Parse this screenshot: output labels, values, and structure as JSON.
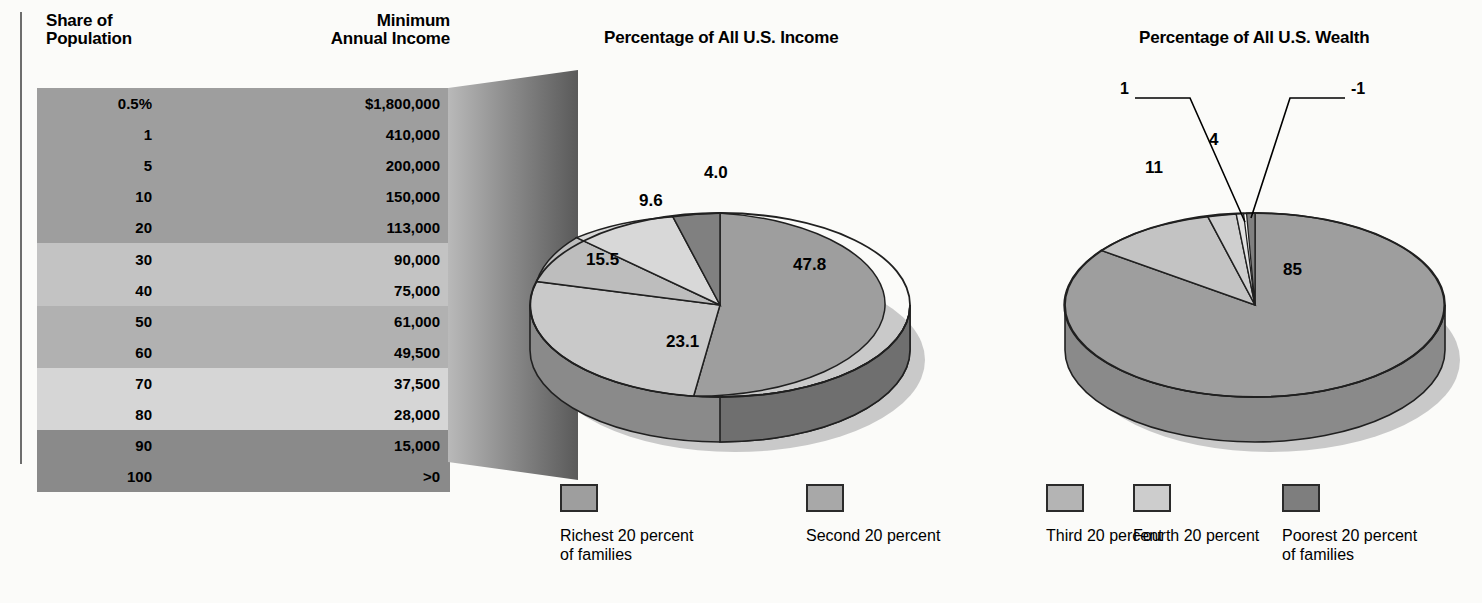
{
  "table": {
    "header_share": "Share of\nPopulation",
    "header_income": "Minimum\nAnnual Income",
    "rows": [
      {
        "pct": "0.5%",
        "amount": "$1,800,000",
        "band": "band-a"
      },
      {
        "pct": "1",
        "amount": "410,000",
        "band": "band-a"
      },
      {
        "pct": "5",
        "amount": "200,000",
        "band": "band-a"
      },
      {
        "pct": "10",
        "amount": "150,000",
        "band": "band-a"
      },
      {
        "pct": "20",
        "amount": "113,000",
        "band": "band-a"
      },
      {
        "pct": "30",
        "amount": "90,000",
        "band": "band-b"
      },
      {
        "pct": "40",
        "amount": "75,000",
        "band": "band-b"
      },
      {
        "pct": "50",
        "amount": "61,000",
        "band": "band-c"
      },
      {
        "pct": "60",
        "amount": "49,500",
        "band": "band-c"
      },
      {
        "pct": "70",
        "amount": "37,500",
        "band": "band-d"
      },
      {
        "pct": "80",
        "amount": "28,000",
        "band": "band-d"
      },
      {
        "pct": "90",
        "amount": "15,000",
        "band": "band-e"
      },
      {
        "pct": "100",
        "amount": ">0",
        "band": "band-e"
      }
    ]
  },
  "legend": {
    "items": [
      {
        "label": "Richest 20 percent\nof families",
        "color": "#9e9e9e"
      },
      {
        "label": "Second 20 percent",
        "color": "#a8a8a8"
      },
      {
        "label": "Third 20 percent",
        "color": "#b4b4b4"
      },
      {
        "label": "Fourth 20 percent",
        "color": "#cdcdcd"
      },
      {
        "label": "Poorest 20 percent\nof families",
        "color": "#7e7e7e"
      }
    ]
  },
  "chart_data": [
    {
      "type": "pie",
      "title": "Percentage of All U.S. Income",
      "categories": [
        "Richest 20 percent of families",
        "Second 20 percent",
        "Third 20 percent",
        "Fourth 20 percent",
        "Poorest 20 percent of families"
      ],
      "values": [
        47.8,
        23.1,
        15.5,
        9.6,
        4.0
      ],
      "labels": [
        "47.8",
        "23.1",
        "15.5",
        "9.6",
        "4.0"
      ],
      "colors": [
        "#9e9e9e",
        "#c9c9c9",
        "#bdbdbd",
        "#d8d8d8",
        "#808080"
      ],
      "legend_position": "bottom",
      "grid": false
    },
    {
      "type": "pie",
      "title": "Percentage of All U.S. Wealth",
      "categories": [
        "Richest 20 percent of families",
        "Second 20 percent",
        "Third 20 percent",
        "Fourth 20 percent",
        "Poorest 20 percent of families"
      ],
      "values": [
        85,
        11,
        4,
        1,
        -1
      ],
      "labels": [
        "85",
        "11",
        "4",
        "1",
        "-1"
      ],
      "colors": [
        "#9e9e9e",
        "#c3c3c3",
        "#cfcfcf",
        "#dedede",
        "#808080"
      ],
      "legend_position": "bottom",
      "grid": false
    }
  ]
}
